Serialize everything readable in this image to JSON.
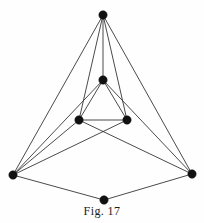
{
  "figure": {
    "caption": "Fig. 17",
    "background_color": "#fefefe",
    "ink_color": "#2a2a2a",
    "vertex_color": "#111111"
  },
  "chart_data": {
    "type": "diagram",
    "title": "Fig. 17",
    "subtitle": "",
    "xlabel": "",
    "ylabel": "",
    "layout": "straight-line drawing",
    "grid": false,
    "legend": null,
    "coordinate_space": {
      "width": 204,
      "height": 223
    },
    "vertex_radius": 4.2,
    "vertex_count": 7,
    "edge_count": 15,
    "nodes": [
      {
        "id": "apex",
        "label": "",
        "x": 103,
        "y": 15
      },
      {
        "id": "inner-top",
        "label": "",
        "x": 103,
        "y": 80
      },
      {
        "id": "inner-left",
        "label": "",
        "x": 79,
        "y": 120
      },
      {
        "id": "inner-right",
        "label": "",
        "x": 127,
        "y": 120
      },
      {
        "id": "outer-left",
        "label": "",
        "x": 13,
        "y": 175
      },
      {
        "id": "outer-right",
        "label": "",
        "x": 192,
        "y": 174
      },
      {
        "id": "bottom",
        "label": "",
        "x": 104,
        "y": 200
      }
    ],
    "edges": [
      {
        "from": "apex",
        "to": "outer-left"
      },
      {
        "from": "apex",
        "to": "inner-left"
      },
      {
        "from": "apex",
        "to": "inner-top"
      },
      {
        "from": "apex",
        "to": "inner-right"
      },
      {
        "from": "apex",
        "to": "outer-right"
      },
      {
        "from": "inner-top",
        "to": "inner-left"
      },
      {
        "from": "inner-top",
        "to": "inner-right"
      },
      {
        "from": "inner-top",
        "to": "outer-left"
      },
      {
        "from": "inner-top",
        "to": "outer-right"
      },
      {
        "from": "inner-left",
        "to": "inner-right"
      },
      {
        "from": "inner-left",
        "to": "outer-left"
      },
      {
        "from": "inner-left",
        "to": "outer-right"
      },
      {
        "from": "inner-right",
        "to": "outer-left"
      },
      {
        "from": "outer-left",
        "to": "bottom"
      },
      {
        "from": "outer-right",
        "to": "bottom"
      }
    ]
  }
}
